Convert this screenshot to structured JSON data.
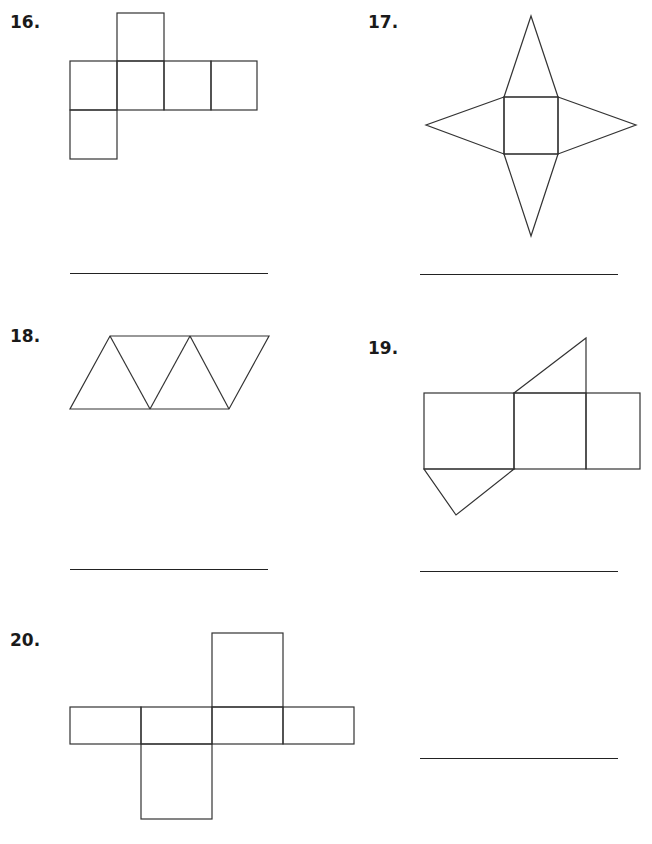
{
  "worksheet": {
    "problems": [
      {
        "number": "16.",
        "shape": "cube-net",
        "answer": ""
      },
      {
        "number": "17.",
        "shape": "square-pyramid-net",
        "answer": ""
      },
      {
        "number": "18.",
        "shape": "triangular-pyramid-net",
        "answer": ""
      },
      {
        "number": "19.",
        "shape": "triangular-prism-net",
        "answer": ""
      },
      {
        "number": "20.",
        "shape": "rectangular-prism-net",
        "answer": ""
      }
    ]
  }
}
